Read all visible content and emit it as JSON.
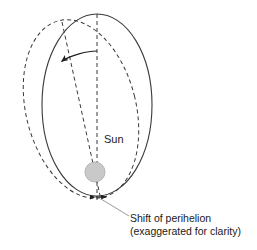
{
  "figure": {
    "background_color": "#ffffff",
    "stroke_color": "#333333",
    "text_color": "#1a1a1a",
    "sun_fill_color": "#c9c9c9",
    "sun_edge_color": "#aaaaaa",
    "leader_color": "#999999"
  },
  "labels": {
    "sun": "Sun",
    "caption_line1": "Shift of perihelion",
    "caption_line2": "(exaggerated for clarity)"
  },
  "geometry": {
    "solid_orbit": {
      "name": "current-orbit",
      "style": "solid",
      "center_x": 97,
      "center_y": 105,
      "rx": 55,
      "ry": 91,
      "rotation_deg": 0
    },
    "dashed_orbit": {
      "name": "shifted-orbit",
      "style": "dashed",
      "center_x": 81,
      "center_y": 109,
      "rx": 55,
      "ry": 91,
      "rotation_deg": -14
    },
    "major_axis_solid": {
      "x1": 97,
      "y1": 14,
      "x2": 97,
      "y2": 202,
      "style": "dashed"
    },
    "major_axis_dashed": {
      "x1": 62,
      "y1": 22,
      "x2": 101,
      "y2": 200,
      "style": "dashed"
    },
    "sun": {
      "cx": 95,
      "cy": 172,
      "r": 10
    },
    "rotation_arrow": {
      "start_x": 97,
      "start_y": 51,
      "end_x": 60,
      "end_y": 62,
      "arrowhead": "left-down"
    },
    "perihelion_marker": {
      "x1": 95,
      "y1": 197,
      "x2": 107,
      "y2": 197,
      "arrowheads": "both"
    },
    "leader_line": {
      "x1": 101,
      "y1": 199,
      "x2": 129,
      "y2": 216
    }
  },
  "text_positions": {
    "sun_x": 104,
    "sun_y": 143,
    "caption_x": 130,
    "caption_y1": 222,
    "caption_y2": 235
  }
}
